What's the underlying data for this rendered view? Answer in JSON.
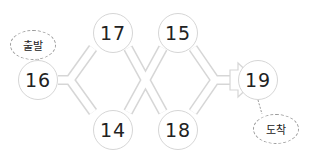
{
  "diagram": {
    "start_label": "출발",
    "end_label": "도착",
    "nodes": {
      "start": "16",
      "top1": "17",
      "bottom1": "14",
      "top2": "15",
      "bottom2": "18",
      "end": "19"
    },
    "colors": {
      "path_outline": "#d6d6d6",
      "path_fill": "#ffffff",
      "text": "#222222"
    }
  }
}
